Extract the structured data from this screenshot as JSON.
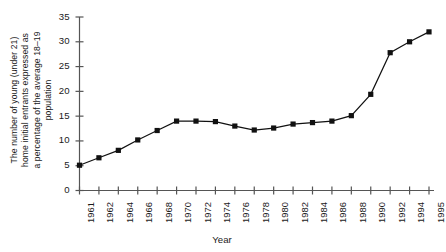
{
  "chart_data": {
    "type": "line",
    "title": "",
    "xlabel": "Year",
    "ylabel": "The number of young (under 21) home initial entrants expressed as a percentage of the average 18–19 population",
    "ylabel_lines": [
      "The number of young (under 21)",
      "home initial entrants expressed as",
      "a percentage of the average 18–19",
      "population"
    ],
    "categories": [
      "1961",
      "1962",
      "1964",
      "1966",
      "1968",
      "1970",
      "1972",
      "1974",
      "1976",
      "1978",
      "1980",
      "1982",
      "1984",
      "1986",
      "1988",
      "1990",
      "1992",
      "1994",
      "1995"
    ],
    "values": [
      5.1,
      6.6,
      8.1,
      10.2,
      12.1,
      14.0,
      14.0,
      13.9,
      13.0,
      12.2,
      12.6,
      13.4,
      13.7,
      14.0,
      15.1,
      19.4,
      27.8,
      30.0,
      32.0
    ],
    "ylim": [
      0,
      35
    ],
    "yticks": [
      0,
      5,
      10,
      15,
      20,
      25,
      30,
      35
    ],
    "ytick_labels": [
      "0",
      "5",
      "10",
      "15",
      "20",
      "25",
      "30",
      "35"
    ],
    "grid": false,
    "legend": "none",
    "marker": "square",
    "series_color": "#111111",
    "line_color": "#111111",
    "axis_color": "#555555",
    "background": "#ffffff"
  }
}
